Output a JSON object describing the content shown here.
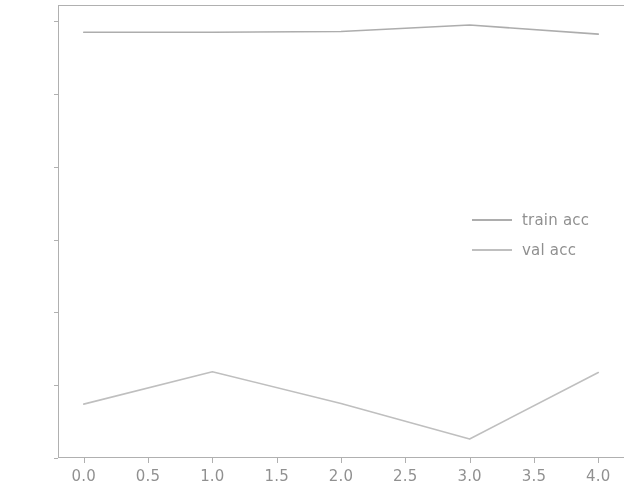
{
  "chart_data": {
    "type": "line",
    "title": "",
    "xlabel": "",
    "ylabel": "",
    "xlim": [
      -0.2,
      4.2
    ],
    "ylim": [
      0.84,
      0.9645
    ],
    "grid": false,
    "legend_position": "center right",
    "x": [
      0,
      1,
      2,
      3,
      4
    ],
    "xticks": [
      0.0,
      0.5,
      1.0,
      1.5,
      2.0,
      2.5,
      3.0,
      3.5,
      4.0
    ],
    "xtick_labels": [
      "0.0",
      "0.5",
      "1.0",
      "1.5",
      "2.0",
      "2.5",
      "3.0",
      "3.5",
      "4.0"
    ],
    "yticks": [
      0.84,
      0.86,
      0.88,
      0.9,
      0.92,
      0.94,
      0.96
    ],
    "ytick_labels": [
      "0.84",
      "0.86",
      "0.88",
      "0.90",
      "0.92",
      "0.94",
      "0.96"
    ],
    "series": [
      {
        "name": "train acc",
        "color": "#8a8a8a",
        "values": [
          0.957,
          0.957,
          0.9572,
          0.959,
          0.9565
        ]
      },
      {
        "name": "val acc",
        "color": "#a8a8a8",
        "values": [
          0.8548,
          0.8637,
          0.855,
          0.8452,
          0.8635
        ]
      }
    ]
  },
  "legend": {
    "entries": [
      {
        "label": "train acc"
      },
      {
        "label": "val acc"
      }
    ]
  },
  "axes": {
    "spine_color": "#8f8f8f",
    "tick_text_color": "#5c5c5c"
  }
}
